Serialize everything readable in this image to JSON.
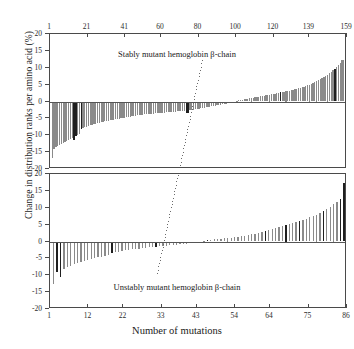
{
  "figure": {
    "xlabel": "Number of mutations",
    "ylabel": "Change in distribution ranks per amino acid (%)"
  },
  "chart_data": {
    "type": "bar",
    "title": "",
    "xlabel": "Number of mutations",
    "ylabel": "Change in distribution ranks per amino acid (%)",
    "grid": false,
    "legend": null,
    "panels": [
      {
        "name": "stably-mutant",
        "caption": "Stably mutant hemoglobin β-chain",
        "axis_position": "top",
        "xlim": [
          1,
          159
        ],
        "ylim": [
          -20,
          20
        ],
        "xticks": [
          1,
          21,
          41,
          60,
          80,
          100,
          120,
          139,
          159
        ],
        "yticks": [
          20,
          15,
          10,
          5,
          0,
          -5,
          -10,
          -15,
          -20
        ],
        "n_bars": 159,
        "values": [
          -16.8,
          -14.2,
          -13.6,
          -13.3,
          -12.9,
          -12.6,
          -12.3,
          -12.0,
          -11.6,
          -11.3,
          -11.1,
          -10.9,
          -11.5,
          -10.2,
          -9.9,
          -9.6,
          -8.2,
          -7.9,
          -7.7,
          -7.5,
          -7.3,
          -7.1,
          -7.0,
          -6.8,
          -6.6,
          -6.5,
          -6.3,
          -6.2,
          -6.0,
          -5.9,
          -5.8,
          -5.7,
          -5.6,
          -5.5,
          -5.4,
          -5.3,
          -5.2,
          -5.1,
          -5.0,
          -4.9,
          -4.8,
          -4.7,
          -4.6,
          -4.5,
          -4.4,
          -4.3,
          -4.2,
          -4.1,
          -4.0,
          -3.95,
          -3.9,
          -3.85,
          -3.8,
          -3.75,
          -3.7,
          -3.65,
          -3.6,
          -3.55,
          -3.5,
          -3.45,
          -3.4,
          -3.35,
          -3.3,
          -3.25,
          -3.2,
          -3.15,
          -3.1,
          -3.05,
          -3.0,
          -2.95,
          -2.9,
          -2.85,
          -2.8,
          -2.75,
          -3.4,
          -3.3,
          -2.6,
          -2.5,
          -2.4,
          -2.3,
          -2.2,
          -2.1,
          -2.0,
          -1.9,
          -1.8,
          -1.7,
          -1.6,
          -1.5,
          -1.4,
          -1.3,
          -1.2,
          -1.1,
          -1.0,
          -0.9,
          -0.8,
          -0.7,
          -0.6,
          -0.5,
          -0.4,
          -0.3,
          -0.2,
          -0.1,
          0.2,
          0.3,
          0.4,
          0.5,
          0.6,
          0.7,
          0.8,
          0.9,
          1.0,
          1.1,
          1.2,
          1.3,
          1.4,
          1.5,
          1.6,
          1.7,
          1.8,
          1.9,
          2.0,
          2.1,
          2.2,
          2.3,
          2.4,
          2.5,
          2.7,
          2.8,
          2.9,
          3.0,
          3.1,
          3.2,
          3.3,
          3.5,
          3.6,
          3.8,
          3.9,
          4.1,
          4.2,
          4.4,
          4.6,
          4.8,
          5.0,
          5.2,
          5.5,
          5.8,
          6.0,
          6.3,
          6.6,
          6.9,
          7.2,
          7.6,
          8.0,
          8.4,
          8.8,
          9.2,
          9.6,
          10.2,
          10.8,
          11.4,
          12.2,
          12.4,
          16.1
        ],
        "dark_indices": [
          12,
          13,
          16,
          74,
          75,
          126,
          156
        ]
      },
      {
        "name": "unstably-mutant",
        "caption": "Unstably mutant hemoglobin β-chain",
        "axis_position": "bottom",
        "xlim": [
          1,
          86
        ],
        "ylim": [
          -20,
          20
        ],
        "xticks": [
          1,
          12,
          22,
          33,
          43,
          54,
          64,
          75,
          86
        ],
        "yticks": [
          20,
          15,
          10,
          5,
          0,
          -5,
          -10,
          -15,
          -20
        ],
        "n_bars": 86,
        "values": [
          -12.6,
          -9.1,
          -10.6,
          -8.0,
          -7.6,
          -7.2,
          -6.8,
          -6.4,
          -6.0,
          -5.7,
          -5.4,
          -5.1,
          -4.9,
          -4.7,
          -4.5,
          -4.3,
          -4.1,
          -3.5,
          -3.2,
          -3.0,
          -2.8,
          -2.6,
          -2.4,
          -2.3,
          -2.2,
          -2.1,
          -1.95,
          -1.85,
          -1.75,
          -1.65,
          -1.55,
          -1.45,
          -1.35,
          -1.25,
          -1.15,
          -1.05,
          -0.95,
          -0.85,
          -0.75,
          -0.65,
          -0.55,
          -0.45,
          -0.35,
          -0.25,
          0.25,
          0.4,
          0.5,
          0.6,
          0.7,
          0.8,
          0.9,
          1.0,
          1.1,
          1.2,
          1.4,
          1.5,
          1.7,
          1.9,
          2.1,
          2.3,
          2.6,
          2.9,
          3.2,
          3.5,
          3.8,
          4.1,
          4.4,
          4.7,
          5.0,
          5.3,
          5.6,
          5.9,
          6.2,
          6.5,
          6.8,
          7.2,
          7.6,
          8.0,
          8.5,
          9.1,
          9.7,
          10.3,
          11.0,
          11.8,
          12.6,
          17.2
        ],
        "dark_indices": [
          1,
          2,
          17,
          30,
          45,
          62,
          68,
          72,
          79,
          84,
          85
        ]
      }
    ],
    "reference_line": {
      "style": "dotted-diagonal",
      "description": "diagonal dotted guide line crossing both panels"
    }
  }
}
